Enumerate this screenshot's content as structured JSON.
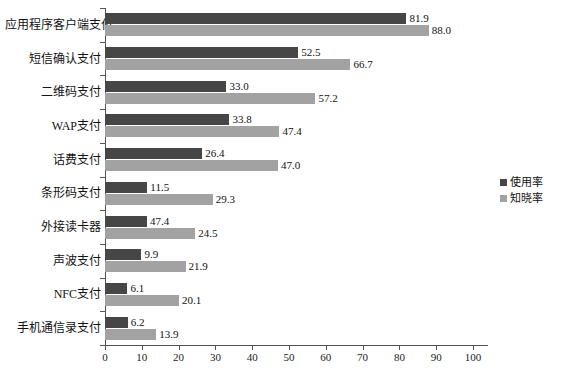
{
  "chart_data": {
    "type": "bar",
    "orientation": "horizontal",
    "title": "",
    "subtitle": "",
    "xlabel": "",
    "ylabel": "",
    "xlim": [
      0,
      100
    ],
    "xticks": [
      0,
      10,
      20,
      30,
      40,
      50,
      60,
      70,
      80,
      90,
      100
    ],
    "grid": false,
    "legend_position": "right",
    "categories": [
      "应用程序客户端支付",
      "短信确认支付",
      "二维码支付",
      "WAP支付",
      "话费支付",
      "条形码支付",
      "外接读卡器",
      "声波支付",
      "NFC支付",
      "手机通信录支付"
    ],
    "series": [
      {
        "name": "使用率",
        "color": "#464646",
        "labels": [
          "81.9",
          "52.5",
          "33.0",
          "33.8",
          "26.4",
          "11.5",
          "47.4",
          "9.9",
          "6.1",
          "6.2"
        ],
        "values": [
          81.9,
          52.5,
          33.0,
          33.8,
          26.4,
          11.5,
          47.4,
          9.9,
          6.1,
          6.2
        ],
        "drawn_lengths": [
          81.9,
          52.5,
          33.0,
          33.8,
          26.4,
          11.5,
          11.4,
          9.9,
          6.1,
          6.2
        ]
      },
      {
        "name": "知晓率",
        "color": "#a2a2a2",
        "labels": [
          "88.0",
          "66.7",
          "57.2",
          "47.4",
          "47.0",
          "29.3",
          "24.5",
          "21.9",
          "20.1",
          "13.9"
        ],
        "values": [
          88.0,
          66.7,
          57.2,
          47.4,
          47.0,
          29.3,
          24.5,
          21.9,
          20.1,
          13.9
        ],
        "drawn_lengths": [
          88.0,
          66.7,
          57.2,
          47.4,
          47.0,
          29.3,
          24.5,
          21.9,
          20.1,
          13.9
        ]
      }
    ]
  },
  "legend": {
    "items": [
      {
        "label": "使用率"
      },
      {
        "label": "知晓率"
      }
    ]
  },
  "axis": {
    "x_tick_labels": [
      "0",
      "10",
      "20",
      "30",
      "40",
      "50",
      "60",
      "70",
      "80",
      "90",
      "100"
    ]
  }
}
